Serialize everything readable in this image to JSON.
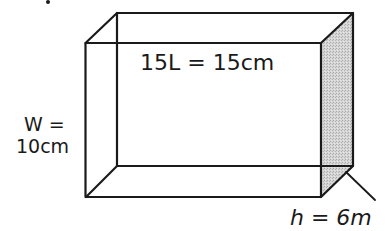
{
  "diagram": {
    "type": "rectangular-prism",
    "labels": {
      "length": "15L = 15cm",
      "width_line1": "W =",
      "width_line2": "10cm",
      "height": "h = 6m"
    },
    "colors": {
      "stroke": "#1a1a1a",
      "shade": "#c8c8c8",
      "background": "#ffffff"
    },
    "vertices": {
      "front_top_left": [
        85,
        43
      ],
      "front_top_right": [
        321,
        43
      ],
      "front_bottom_left": [
        86,
        197
      ],
      "front_bottom_right": [
        321,
        197
      ],
      "back_top_left": [
        117,
        13
      ],
      "back_top_right": [
        353,
        13
      ],
      "back_bottom_left": [
        117,
        166
      ],
      "back_bottom_right": [
        353,
        165
      ]
    }
  }
}
